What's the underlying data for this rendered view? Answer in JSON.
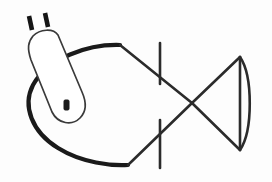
{
  "figure": {
    "background_color": "#fdfdfd",
    "ink_color": "#1a1a1a",
    "width": 272,
    "height": 182
  },
  "parts": {
    "body_label": "fish-body-oval",
    "tail_label": "fish-tail-triangle",
    "tail_arc_label": "fish-tail-curved-edge",
    "crossbar_upper_label": "vertical-bar-upper-segment",
    "crossbar_lower_label": "vertical-bar-lower-segment",
    "plug_label": "plug-capsule-outline",
    "prong_left_label": "plug-prong-left",
    "prong_right_label": "plug-prong-right",
    "slot_label": "plug-slot"
  },
  "geometry": {
    "body_path": "M 120,45 C 88,44 48,58 33,85 C 22,106 32,132 58,148 C 82,163 112,166 128,165",
    "body_top_diag": "M 120,45 L 192,103",
    "body_bottom_diag": "M 128,165 L 192,103",
    "tail_upper": "M 192,103 L 240,57",
    "tail_lower": "M 192,103 L 240,150",
    "tail_chord": "M 240,57 L 240,150",
    "tail_arc": "M 240,57 C 253,76 253,131 240,150",
    "bar_upper": "M 160,43 L 160,84",
    "bar_lower": "M 160,120 L 160,168",
    "plug_outline": "M 33,36 C 28,42 27,48 31,60 L 52,112 C 58,124 72,126 80,118 C 87,111 86,101 82,92 L 58,35 C 53,28 40,29 33,36 Z",
    "prong_left": "M 32,30 L 29,16",
    "prong_right": "M 48,27 L 45,13",
    "slot_rect": {
      "x": 64,
      "y": 100,
      "width": 5,
      "height": 10,
      "rx": 1.2
    }
  }
}
